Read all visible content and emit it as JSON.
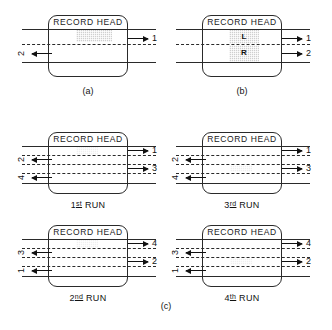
{
  "figure": {
    "head_label": "RECORD HEAD",
    "panel_a_caption": "(a)",
    "panel_b_caption": "(b)",
    "panel_c_caption": "(c)"
  },
  "panel_a": {
    "caption": "(a)",
    "head_label": "RECORD HEAD",
    "right_labels": [
      "1"
    ],
    "left_labels": [
      "2"
    ],
    "tracks": [
      {
        "num": "1",
        "side": "right",
        "direction": "right"
      },
      {
        "num": "2",
        "side": "left",
        "direction": "left"
      }
    ]
  },
  "panel_b": {
    "caption": "(b)",
    "head_label": "RECORD HEAD",
    "channel_upper": "L",
    "channel_lower": "R",
    "right_labels": [
      "1",
      "2"
    ],
    "tracks": [
      {
        "num": "1",
        "side": "right",
        "direction": "right",
        "channel": "L"
      },
      {
        "num": "2",
        "side": "right",
        "direction": "right",
        "channel": "R"
      }
    ]
  },
  "panel_c": {
    "caption": "(c)",
    "runs": [
      {
        "name": "run-1",
        "label_prefix": "1",
        "label_ordinal": "st",
        "label_suffix": "RUN",
        "head_label": "RECORD HEAD",
        "tracks": [
          {
            "num": "1",
            "side": "right",
            "direction": "right"
          },
          {
            "num": "2",
            "side": "left",
            "direction": "left"
          },
          {
            "num": "3",
            "side": "right",
            "direction": "right"
          },
          {
            "num": "4",
            "side": "left",
            "direction": "left"
          }
        ]
      },
      {
        "name": "run-3",
        "label_prefix": "3",
        "label_ordinal": "rd",
        "label_suffix": "RUN",
        "head_label": "RECORD HEAD",
        "tracks": [
          {
            "num": "1",
            "side": "right",
            "direction": "right"
          },
          {
            "num": "2",
            "side": "left",
            "direction": "left"
          },
          {
            "num": "3",
            "side": "right",
            "direction": "right"
          },
          {
            "num": "4",
            "side": "left",
            "direction": "left"
          }
        ]
      },
      {
        "name": "run-2",
        "label_prefix": "2",
        "label_ordinal": "nd",
        "label_suffix": "RUN",
        "head_label": "RECORD HEAD",
        "tracks": [
          {
            "num": "4",
            "side": "right",
            "direction": "right"
          },
          {
            "num": "3",
            "side": "left",
            "direction": "left"
          },
          {
            "num": "2",
            "side": "right",
            "direction": "right"
          },
          {
            "num": "1",
            "side": "left",
            "direction": "left"
          }
        ]
      },
      {
        "name": "run-4",
        "label_prefix": "4",
        "label_ordinal": "th",
        "label_suffix": "RUN",
        "head_label": "RECORD HEAD",
        "tracks": [
          {
            "num": "4",
            "side": "right",
            "direction": "right"
          },
          {
            "num": "3",
            "side": "left",
            "direction": "left"
          },
          {
            "num": "2",
            "side": "right",
            "direction": "right"
          },
          {
            "num": "1",
            "side": "left",
            "direction": "left"
          }
        ]
      }
    ]
  },
  "colors": {
    "ink": "#1a1a1a",
    "shade": "#cfcfcf",
    "background": "#ffffff"
  }
}
